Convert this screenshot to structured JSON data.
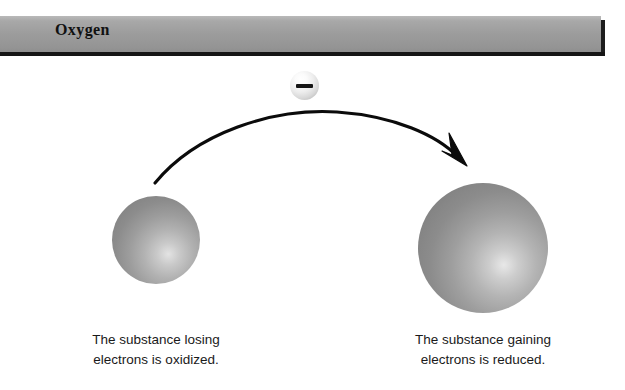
{
  "figure": {
    "background_color": "#ffffff",
    "width": 625,
    "height": 390
  },
  "header": {
    "title": "Oxygen",
    "band_color": "#9c9c9c",
    "border_color": "#151515",
    "title_color": "#111111"
  },
  "diagram": {
    "type": "redox-electron-transfer",
    "electron": {
      "label": "electron",
      "charge_symbol": "−",
      "sphere_color": "#ededed"
    },
    "arrow": {
      "name": "electron-transfer-arrow",
      "direction": "left-to-right",
      "color": "#000000",
      "start": "donor-sphere",
      "end": "acceptor-sphere"
    },
    "spheres": [
      {
        "name": "donor-sphere",
        "role": "oxidized",
        "color": "#9a9a9a",
        "diameter": 88
      },
      {
        "name": "acceptor-sphere",
        "role": "reduced",
        "color": "#979797",
        "diameter": 130
      }
    ],
    "captions": {
      "left": {
        "line1": "The substance losing",
        "line2": "electrons is oxidized."
      },
      "right": {
        "line1": "The substance gaining",
        "line2": "electrons is reduced."
      }
    }
  }
}
